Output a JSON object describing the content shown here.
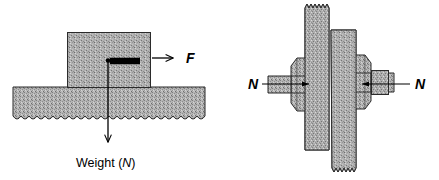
{
  "figure": {
    "title": "",
    "background_color": "#ffffff",
    "hatch_color": "#a8a8a8",
    "line_color": "#000000",
    "panels": [
      {
        "id": "left-panel",
        "name": "block-on-ground-friction-diagram",
        "labels": [
          {
            "name": "applied-force-label",
            "text": "F",
            "style": "italic",
            "x": 188,
            "y": 58
          },
          {
            "name": "weight-label-prefix",
            "text": "Weight (",
            "x": 77,
            "y": 166
          },
          {
            "name": "weight-label-symbol",
            "text": "N",
            "style": "italic",
            "x": 133,
            "y": 166
          },
          {
            "name": "weight-label-suffix",
            "text": ")",
            "x": 143,
            "y": 166
          }
        ],
        "arrows": [
          {
            "name": "applied-force-arrow",
            "kind": "open",
            "from_x": 152,
            "from_y": 58,
            "to_x": 178,
            "to_y": 58
          },
          {
            "name": "friction-force-arrow",
            "kind": "solid",
            "from_x": 108,
            "from_y": 61,
            "to_x": 146,
            "to_y": 61
          },
          {
            "name": "weight-arrow",
            "kind": "open-down",
            "from_x": 108,
            "from_y": 61,
            "to_x": 108,
            "to_y": 148
          }
        ],
        "shapes": [
          {
            "name": "sliding-block",
            "x": 67,
            "y": 32,
            "w": 84,
            "h": 55
          },
          {
            "name": "ground-surface",
            "x": 13,
            "y": 87,
            "w": 192,
            "h": 35
          }
        ]
      },
      {
        "id": "right-panel",
        "name": "bolted-joint-normal-force-diagram",
        "labels": [
          {
            "name": "normal-force-label-left",
            "text": "N",
            "style": "italic",
            "x": 251,
            "y": 88
          },
          {
            "name": "normal-force-label-right",
            "text": "N",
            "style": "italic",
            "x": 417,
            "y": 88
          }
        ],
        "arrows": [
          {
            "name": "normal-force-arrow-left",
            "kind": "solid-thin",
            "from_x": 261,
            "from_y": 84,
            "to_x": 314,
            "to_y": 84
          },
          {
            "name": "normal-force-arrow-right",
            "kind": "solid-thin",
            "from_x": 410,
            "from_y": 84,
            "to_x": 358,
            "to_y": 84
          }
        ],
        "shapes": [
          {
            "name": "plate-rear",
            "x": 305,
            "y": 5,
            "w": 24,
            "h": 160
          },
          {
            "name": "plate-front",
            "x": 331,
            "y": 30,
            "w": 25,
            "h": 145
          },
          {
            "name": "nut-left",
            "x": 291,
            "y": 57,
            "w": 27,
            "h": 55
          },
          {
            "name": "nut-right",
            "x": 343,
            "y": 55,
            "w": 28,
            "h": 55
          },
          {
            "name": "bolt-end",
            "x": 371,
            "y": 70,
            "w": 17,
            "h": 24
          }
        ]
      }
    ]
  }
}
